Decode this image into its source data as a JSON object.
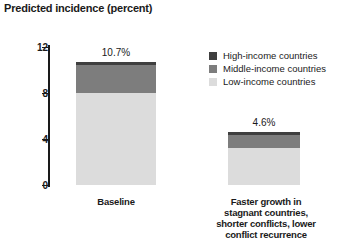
{
  "chart_data": {
    "type": "bar",
    "title": "Predicted incidence (percent)",
    "xlabel": "",
    "ylabel": "",
    "ylim": [
      0,
      12
    ],
    "yticks": [
      "0",
      "4",
      "8",
      "12"
    ],
    "grid": false,
    "stacked": true,
    "legend_position": "right-top",
    "categories": [
      "Baseline",
      "Faster growth in stagnant countries, shorter conflicts, lower conflict recurrence"
    ],
    "category_lines": [
      [
        "Baseline"
      ],
      [
        "Faster growth in",
        "stagnant countries,",
        "shorter conflicts, lower",
        "conflict recurrence"
      ]
    ],
    "series": [
      {
        "name": "High-income countries",
        "color": "#3f3f3f",
        "values": [
          0.3,
          0.25
        ]
      },
      {
        "name": "Middle-income countries",
        "color": "#7d7d7d",
        "values": [
          2.4,
          1.15
        ]
      },
      {
        "name": "Low-income countries",
        "color": "#dcdcdc",
        "values": [
          8.0,
          3.2
        ]
      }
    ],
    "totals": [
      10.7,
      4.6
    ],
    "data_labels": [
      "10.7%",
      "4.6%"
    ]
  },
  "legend": {
    "items": [
      {
        "label": "High-income countries",
        "color": "#3f3f3f"
      },
      {
        "label": "Middle-income countries",
        "color": "#7d7d7d"
      },
      {
        "label": "Low-income countries",
        "color": "#dcdcdc"
      }
    ]
  },
  "axis": {
    "ticks": [
      {
        "label": "12",
        "value": 12
      },
      {
        "label": "8",
        "value": 8
      },
      {
        "label": "4",
        "value": 4
      },
      {
        "label": "0",
        "value": 0
      }
    ]
  }
}
